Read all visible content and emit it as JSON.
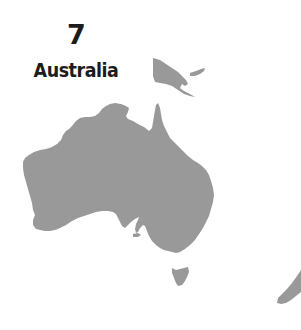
{
  "label": {
    "rank": "7",
    "country": "Australia"
  },
  "map": {
    "land_color": "#999999",
    "background_color": "#ffffff",
    "regions": [
      "Australia",
      "Tasmania",
      "Papua New Guinea",
      "New Zealand"
    ]
  }
}
